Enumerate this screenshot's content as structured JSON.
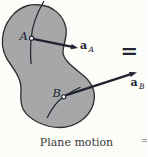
{
  "figure": {
    "caption": "Plane motion",
    "equals_sign": "=",
    "adjacent_clipped_mark": "=",
    "points": [
      {
        "label": "A",
        "vector_symbol": "a",
        "vector_subscript": "A"
      },
      {
        "label": "B",
        "vector_symbol": "a",
        "vector_subscript": "B"
      }
    ],
    "colors": {
      "background": "#fcfcf9",
      "body_fill": "#a6a7a9",
      "body_outline": "#2d2d2d",
      "ink": "#20222f",
      "caption": "#3a3a3a",
      "clipped_mark": "#9a9aa6",
      "marker_fill": "#ffffff"
    }
  }
}
